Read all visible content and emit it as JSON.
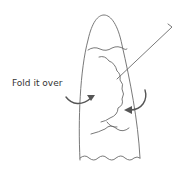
{
  "diagram": {
    "annotation_label": "Fold it over",
    "colors": {
      "outline": "#6a6a6a",
      "arrow": "#555555",
      "text": "#333333",
      "background": "#ffffff"
    },
    "elements": [
      {
        "id": "cone-outline",
        "description": "tall rounded cone shape"
      },
      {
        "id": "fold-edge",
        "description": "wavy horizontal fold line near top"
      },
      {
        "id": "filling",
        "description": "scalloped cloud-like filling area"
      },
      {
        "id": "pointer-line",
        "description": "leader line to upper-right corner"
      },
      {
        "id": "left-arrow",
        "description": "curved arrow from left pointing inward"
      },
      {
        "id": "right-arrow",
        "description": "curved arrow from right pointing inward"
      },
      {
        "id": "bottom-wave",
        "description": "wavy bottom edge"
      }
    ]
  }
}
